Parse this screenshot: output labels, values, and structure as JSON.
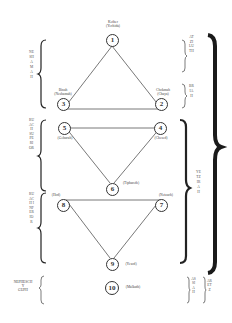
{
  "diagram": {
    "type": "sephirotic-tree-soul-levels",
    "nodes": [
      {
        "id": 1,
        "number": "1",
        "name": "Kether",
        "soul": "(Yechida)"
      },
      {
        "id": 2,
        "number": "2",
        "name": "Chokmah",
        "soul": "(Chaya)"
      },
      {
        "id": 3,
        "number": "3",
        "name": "Binah",
        "soul": "(Neshamah)"
      },
      {
        "id": 4,
        "number": "4",
        "name": "(Chesed)"
      },
      {
        "id": 5,
        "number": "5",
        "name": "(Geburah)"
      },
      {
        "id": 6,
        "number": "6",
        "name": "(Tiphareth)"
      },
      {
        "id": 7,
        "number": "7",
        "name": "(Netzach)"
      },
      {
        "id": 8,
        "number": "8",
        "name": "(Hod)"
      },
      {
        "id": 9,
        "number": "9",
        "name": "(Yesod)"
      },
      {
        "id": 10,
        "number": "10",
        "name": "(Malkuth)"
      }
    ],
    "left_brackets": [
      {
        "label": "NESHAMAH"
      },
      {
        "label": "RUACH SUPERIOR"
      },
      {
        "label": "RUACH INFERIOR"
      },
      {
        "label": "NEPHESCH Y GUPH",
        "lines": [
          "NEPHESCH",
          "Y",
          "GUPH"
        ]
      }
    ],
    "right_inner_brackets": [
      {
        "label": "ATZILUTH"
      },
      {
        "label": "BRIAH"
      },
      {
        "label": "YETZIRAH"
      },
      {
        "label": "ASSIAH"
      }
    ],
    "right_outer_brackets": [
      {
        "label": "ARETZ"
      }
    ],
    "colors": {
      "line": "#555555",
      "bracket": "#222222",
      "background": "#ffffff"
    }
  }
}
